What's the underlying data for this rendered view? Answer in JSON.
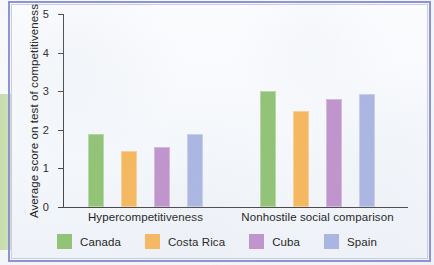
{
  "figure": {
    "frame_color": "#8d93cf",
    "edge_stripe_color": "#cfe0b4"
  },
  "chart_data": {
    "type": "bar",
    "title": "",
    "xlabel": "",
    "ylabel": "Average score on test of competitiveness",
    "ylim": [
      0,
      5
    ],
    "ytick_labels": [
      "0",
      "1",
      "2",
      "3",
      "4",
      "5"
    ],
    "ytick_values": [
      0,
      1,
      2,
      3,
      4,
      5
    ],
    "grid": false,
    "legend_position": "bottom",
    "categories": [
      "Hypercompetitiveness",
      "Nonhostile social comparison"
    ],
    "series": [
      {
        "name": "Canada",
        "color": "#92c377",
        "values": [
          1.9,
          3.0
        ]
      },
      {
        "name": "Costa Rica",
        "color": "#f5b860",
        "values": [
          1.45,
          2.5
        ]
      },
      {
        "name": "Cuba",
        "color": "#c093cc",
        "values": [
          1.55,
          2.8
        ]
      },
      {
        "name": "Spain",
        "color": "#aab6e2",
        "values": [
          1.9,
          2.93
        ]
      }
    ]
  }
}
